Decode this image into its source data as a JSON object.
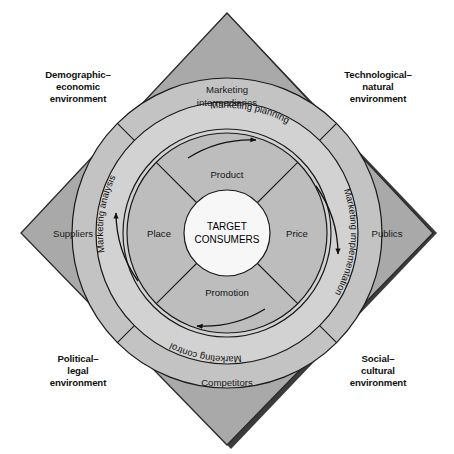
{
  "diagram": {
    "type": "concentric-diamond-diagram",
    "colors": {
      "background": "#ffffff",
      "diamond_fill": "#a9a9a9",
      "diamond_shadow": "#3b3b3b",
      "outer_ring_fill": "#c3c3c3",
      "process_ring_fill": "#d2d2d2",
      "mix_ring_fill": "#bdbdbd",
      "center_fill": "#f2f2f2",
      "stroke": "#1a1a1a",
      "text": "#111111"
    }
  },
  "environment_labels": [
    {
      "id": "demographic-economic",
      "line1": "Demographic–",
      "line2": "economic",
      "line3": "environment"
    },
    {
      "id": "technological-natural",
      "line1": "Technological–",
      "line2": "natural",
      "line3": "environment"
    },
    {
      "id": "political-legal",
      "line1": "Political–",
      "line2": "legal",
      "line3": "environment"
    },
    {
      "id": "social-cultural",
      "line1": "Social–",
      "line2": "cultural",
      "line3": "environment"
    }
  ],
  "actor_labels": [
    {
      "id": "marketing-intermediaries",
      "line1": "Marketing",
      "line2": "intermediaries"
    },
    {
      "id": "suppliers",
      "line1": "Suppliers",
      "line2": ""
    },
    {
      "id": "publics",
      "line1": "Publics",
      "line2": ""
    },
    {
      "id": "competitors",
      "line1": "Competitors",
      "line2": ""
    }
  ],
  "process_ring": [
    {
      "id": "marketing-analysis",
      "label": "Marketing analysis"
    },
    {
      "id": "marketing-planning",
      "label": "Marketing planning"
    },
    {
      "id": "marketing-implementation",
      "label": "Marketing implementation"
    },
    {
      "id": "marketing-control",
      "label": "Marketing control"
    }
  ],
  "marketing_mix": [
    {
      "id": "product",
      "label": "Product"
    },
    {
      "id": "price",
      "label": "Price"
    },
    {
      "id": "promotion",
      "label": "Promotion"
    },
    {
      "id": "place",
      "label": "Place"
    }
  ],
  "center": {
    "line1": "TARGET",
    "line2": "CONSUMERS"
  }
}
